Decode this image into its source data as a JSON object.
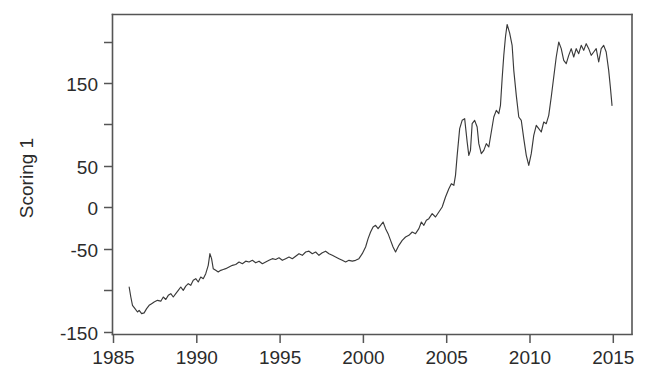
{
  "chart_data": {
    "type": "line",
    "title": "",
    "xlabel": "",
    "ylabel": "Scoring 1",
    "xlim": [
      1985.0,
      2016.2
    ],
    "ylim": [
      -157.0,
      227.0
    ],
    "grid": false,
    "legend": "none",
    "line_color": "#3a3a3a",
    "axis_color": "#555555",
    "background": "#ffffff",
    "xticks": [
      1985,
      1990,
      1995,
      2000,
      2005,
      2010,
      2015
    ],
    "xtick_labels": [
      "1985",
      "1990",
      "1995",
      "2000",
      "2005",
      "2010",
      "2015"
    ],
    "yticks": [
      -150,
      -100,
      -50,
      0,
      50,
      100,
      150,
      200
    ],
    "ytick_labels": [
      "-150",
      "",
      "-50",
      "0",
      "50",
      "",
      "150",
      ""
    ],
    "ytick_labels_visible": [
      "-150",
      "-50",
      "0",
      "50",
      "150"
    ],
    "series": [
      {
        "name": "Scoring 1",
        "x": [
          1986.0,
          1986.1,
          1986.2,
          1986.35,
          1986.5,
          1986.6,
          1986.75,
          1986.9,
          1987.05,
          1987.2,
          1987.35,
          1987.5,
          1987.7,
          1987.9,
          1988.05,
          1988.2,
          1988.35,
          1988.5,
          1988.65,
          1988.8,
          1988.95,
          1989.1,
          1989.25,
          1989.4,
          1989.55,
          1989.7,
          1989.85,
          1990.0,
          1990.15,
          1990.3,
          1990.45,
          1990.6,
          1990.75,
          1990.85,
          1990.95,
          1991.05,
          1991.2,
          1991.35,
          1991.5,
          1991.65,
          1991.8,
          1992.0,
          1992.2,
          1992.4,
          1992.6,
          1992.8,
          1993.0,
          1993.2,
          1993.4,
          1993.6,
          1993.8,
          1994.0,
          1994.2,
          1994.4,
          1994.6,
          1994.8,
          1995.0,
          1995.2,
          1995.4,
          1995.6,
          1995.8,
          1996.0,
          1996.2,
          1996.4,
          1996.6,
          1996.8,
          1997.0,
          1997.2,
          1997.4,
          1997.6,
          1997.8,
          1998.0,
          1998.2,
          1998.4,
          1998.6,
          1998.8,
          1999.0,
          1999.2,
          1999.4,
          1999.6,
          1999.8,
          2000.0,
          2000.2,
          2000.35,
          2000.5,
          2000.65,
          2000.8,
          2000.95,
          2001.1,
          2001.25,
          2001.4,
          2001.55,
          2001.7,
          2001.85,
          2002.0,
          2002.2,
          2002.4,
          2002.6,
          2002.8,
          2003.0,
          2003.2,
          2003.4,
          2003.55,
          2003.7,
          2003.85,
          2004.0,
          2004.2,
          2004.4,
          2004.6,
          2004.8,
          2005.0,
          2005.2,
          2005.35,
          2005.5,
          2005.6,
          2005.7,
          2005.85,
          2006.0,
          2006.15,
          2006.3,
          2006.4,
          2006.5,
          2006.6,
          2006.75,
          2006.9,
          2007.0,
          2007.15,
          2007.3,
          2007.45,
          2007.6,
          2007.75,
          2007.9,
          2008.05,
          2008.2,
          2008.3,
          2008.4,
          2008.5,
          2008.6,
          2008.7,
          2008.85,
          2009.0,
          2009.1,
          2009.25,
          2009.4,
          2009.55,
          2009.7,
          2009.85,
          2010.0,
          2010.15,
          2010.3,
          2010.45,
          2010.6,
          2010.75,
          2010.9,
          2011.05,
          2011.2,
          2011.35,
          2011.5,
          2011.65,
          2011.8,
          2011.95,
          2012.1,
          2012.25,
          2012.4,
          2012.55,
          2012.7,
          2012.85,
          2013.0,
          2013.15,
          2013.3,
          2013.45,
          2013.6,
          2013.75,
          2013.9,
          2014.05,
          2014.2,
          2014.35,
          2014.5,
          2014.65,
          2014.8,
          2014.9,
          2015.0
        ],
        "y": [
          -100,
          -112,
          -122,
          -126,
          -130,
          -128,
          -132,
          -131,
          -126,
          -122,
          -120,
          -118,
          -116,
          -117,
          -112,
          -115,
          -110,
          -108,
          -112,
          -108,
          -104,
          -100,
          -104,
          -99,
          -96,
          -98,
          -92,
          -90,
          -94,
          -88,
          -90,
          -84,
          -74,
          -60,
          -66,
          -78,
          -80,
          -82,
          -80,
          -79,
          -78,
          -76,
          -74,
          -73,
          -70,
          -72,
          -69,
          -70,
          -68,
          -71,
          -69,
          -72,
          -70,
          -68,
          -66,
          -67,
          -65,
          -68,
          -66,
          -64,
          -66,
          -63,
          -60,
          -62,
          -58,
          -57,
          -60,
          -58,
          -62,
          -59,
          -57,
          -60,
          -62,
          -64,
          -66,
          -68,
          -70,
          -68,
          -69,
          -68,
          -66,
          -60,
          -52,
          -42,
          -34,
          -28,
          -26,
          -30,
          -26,
          -22,
          -30,
          -36,
          -44,
          -52,
          -58,
          -50,
          -44,
          -40,
          -38,
          -34,
          -36,
          -30,
          -22,
          -26,
          -20,
          -18,
          -12,
          -16,
          -10,
          -4,
          8,
          18,
          24,
          22,
          34,
          58,
          90,
          100,
          102,
          74,
          58,
          64,
          96,
          100,
          92,
          72,
          60,
          64,
          72,
          68,
          86,
          104,
          112,
          108,
          118,
          150,
          178,
          200,
          215,
          205,
          190,
          160,
          130,
          104,
          100,
          78,
          58,
          46,
          60,
          82,
          94,
          90,
          86,
          98,
          96,
          106,
          128,
          152,
          176,
          194,
          186,
          172,
          168,
          178,
          186,
          176,
          186,
          180,
          190,
          184,
          192,
          186,
          178,
          182,
          186,
          170,
          186,
          190,
          182,
          160,
          140,
          118
        ]
      }
    ]
  },
  "axis": {
    "y_title": "Scoring 1",
    "x_tick_1": "1985",
    "x_tick_2": "1990",
    "x_tick_3": "1995",
    "x_tick_4": "2000",
    "x_tick_5": "2005",
    "x_tick_6": "2010",
    "x_tick_7": "2015",
    "y_tick_1": "150",
    "y_tick_2": "50",
    "y_tick_3": "0",
    "y_tick_4": "-50",
    "y_tick_5": "-150"
  }
}
